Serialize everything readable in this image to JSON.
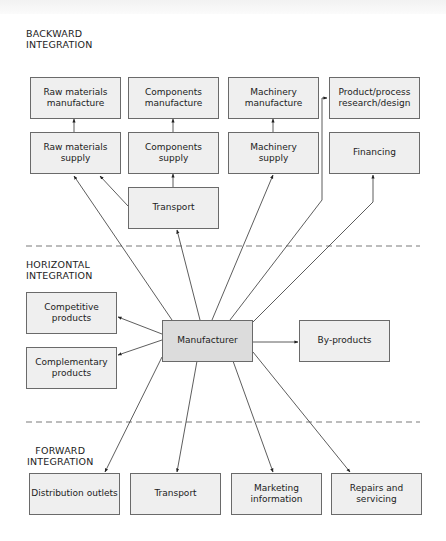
{
  "sections": {
    "backward": {
      "label": "BACKWARD\nINTEGRATION"
    },
    "horizontal": {
      "label": "HORIZONTAL\nINTEGRATION"
    },
    "forward": {
      "label": "FORWARD\nINTEGRATION"
    }
  },
  "backward": {
    "row1": [
      {
        "id": "raw-materials-manufacture",
        "label": "Raw materials\nmanufacture"
      },
      {
        "id": "components-manufacture",
        "label": "Components\nmanufacture"
      },
      {
        "id": "machinery-manufacture",
        "label": "Machinery\nmanufacture"
      },
      {
        "id": "product-process-research",
        "label": "Product/process\nresearch/design"
      }
    ],
    "row2": [
      {
        "id": "raw-materials-supply",
        "label": "Raw materials\nsupply"
      },
      {
        "id": "components-supply",
        "label": "Components\nsupply"
      },
      {
        "id": "machinery-supply",
        "label": "Machinery\nsupply"
      },
      {
        "id": "financing",
        "label": "Financing"
      }
    ],
    "transport": {
      "id": "transport-backward",
      "label": "Transport"
    }
  },
  "horizontal": {
    "competitive": {
      "label": "Competitive\nproducts"
    },
    "complementary": {
      "label": "Complementary\nproducts"
    },
    "manufacturer": {
      "label": "Manufacturer"
    },
    "byproducts": {
      "label": "By-products"
    }
  },
  "forward": {
    "items": [
      {
        "id": "distribution-outlets",
        "label": "Distribution outlets"
      },
      {
        "id": "transport-forward",
        "label": "Transport"
      },
      {
        "id": "marketing-information",
        "label": "Marketing\ninformation"
      },
      {
        "id": "repairs-servicing",
        "label": "Repairs and\nservicing"
      }
    ]
  },
  "colors": {
    "box_fill": "#efefef",
    "central_fill": "#dcdcdc",
    "border": "#6a6a6a",
    "line": "#333333",
    "divider": "#7a7a7a"
  }
}
